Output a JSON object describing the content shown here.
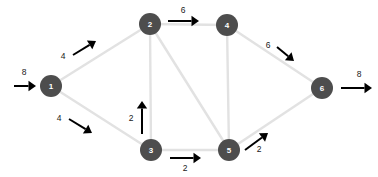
{
  "diagram": {
    "type": "network-flow-graph",
    "title": "",
    "node_color": "#4d4d4d",
    "node_label_color": "#ffffff",
    "edge_color": "#e2e2e2",
    "arrow_color": "#000000",
    "background": "#ffffff",
    "nodes": [
      {
        "id": "1",
        "label": "1",
        "x": 51,
        "y": 86,
        "r": 11
      },
      {
        "id": "2",
        "label": "2",
        "x": 150,
        "y": 24,
        "r": 11
      },
      {
        "id": "3",
        "label": "3",
        "x": 151,
        "y": 150,
        "r": 11
      },
      {
        "id": "4",
        "label": "4",
        "x": 227,
        "y": 25,
        "r": 11
      },
      {
        "id": "5",
        "label": "5",
        "x": 229,
        "y": 150,
        "r": 11
      },
      {
        "id": "6",
        "label": "6",
        "x": 322,
        "y": 88,
        "r": 11
      }
    ],
    "edges": [
      {
        "from": "1",
        "to": "2"
      },
      {
        "from": "1",
        "to": "3"
      },
      {
        "from": "2",
        "to": "4"
      },
      {
        "from": "2",
        "to": "3"
      },
      {
        "from": "2",
        "to": "5"
      },
      {
        "from": "4",
        "to": "5"
      },
      {
        "from": "4",
        "to": "6"
      },
      {
        "from": "3",
        "to": "5"
      },
      {
        "from": "5",
        "to": "6"
      }
    ],
    "flows": [
      {
        "name": "flow-source-into-1",
        "value": "8",
        "label_x": 24,
        "label_y": 72,
        "arrow": {
          "x1": 14,
          "y1": 86,
          "x2": 36,
          "y2": 86
        }
      },
      {
        "name": "flow-1-to-2",
        "value": "4",
        "label_x": 63,
        "label_y": 56,
        "arrow": {
          "x1": 73,
          "y1": 55,
          "x2": 96,
          "y2": 41
        }
      },
      {
        "name": "flow-1-to-3",
        "value": "4",
        "label_x": 59,
        "label_y": 118,
        "arrow": {
          "x1": 69,
          "y1": 119,
          "x2": 92,
          "y2": 133
        }
      },
      {
        "name": "flow-3-to-2",
        "value": "2",
        "label_x": 131,
        "label_y": 118,
        "arrow": {
          "x1": 142,
          "y1": 134,
          "x2": 142,
          "y2": 101
        }
      },
      {
        "name": "flow-2-to-4",
        "value": "6",
        "label_x": 183,
        "label_y": 10,
        "arrow": {
          "x1": 168,
          "y1": 21,
          "x2": 199,
          "y2": 21
        }
      },
      {
        "name": "flow-3-to-5",
        "value": "2",
        "label_x": 185,
        "label_y": 168,
        "arrow": {
          "x1": 170,
          "y1": 158,
          "x2": 201,
          "y2": 158
        }
      },
      {
        "name": "flow-4-to-6",
        "value": "6",
        "label_x": 268,
        "label_y": 45,
        "arrow": {
          "x1": 277,
          "y1": 47,
          "x2": 294,
          "y2": 61
        }
      },
      {
        "name": "flow-5-to-6",
        "value": "2",
        "label_x": 259,
        "label_y": 149,
        "arrow": {
          "x1": 245,
          "y1": 150,
          "x2": 268,
          "y2": 133
        }
      },
      {
        "name": "flow-6-to-sink",
        "value": "8",
        "label_x": 359,
        "label_y": 74,
        "arrow": {
          "x1": 341,
          "y1": 88,
          "x2": 372,
          "y2": 88
        }
      }
    ]
  }
}
